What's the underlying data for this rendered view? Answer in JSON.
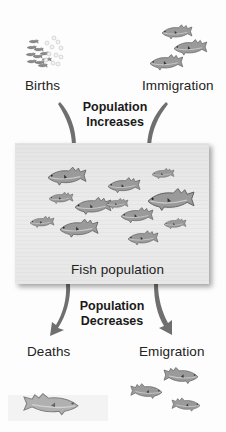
{
  "figure": {
    "sources": {
      "births": {
        "label": "Births",
        "icon": "fish-eggs-and-fry-icon"
      },
      "immigration": {
        "label": "Immigration",
        "icon": "fish-group-arriving-icon"
      }
    },
    "increase_label_line1": "Population",
    "increase_label_line2": "Increases",
    "center": {
      "label": "Fish population",
      "fish_count": 12
    },
    "decrease_label_line1": "Population",
    "decrease_label_line2": "Decreases",
    "sinks": {
      "deaths": {
        "label": "Deaths",
        "icon": "dead-fish-icon"
      },
      "emigration": {
        "label": "Emigration",
        "icon": "fish-group-leaving-icon"
      }
    },
    "colors": {
      "arrow": "#6f6f6f",
      "box": "#e8e8e8",
      "fish": "#8c8c8c",
      "text": "#222222"
    }
  }
}
